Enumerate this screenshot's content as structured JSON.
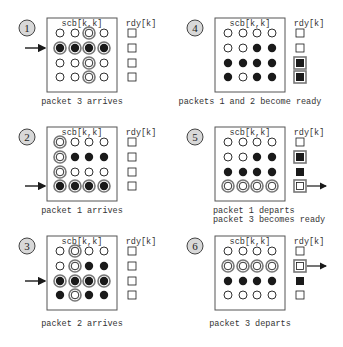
{
  "colors": {
    "ink": "#1a1a1a",
    "ring": "#777777",
    "badge_fill": "#d8d8d8",
    "frame": "#555555"
  },
  "labels": {
    "matrix": "scb[k,k]",
    "ready": "rdy[k]"
  },
  "legend_states": {
    "o": "empty",
    "f": "filled",
    "r": "ring (highlighted empty)",
    "F": "filled with ring (highlighted filled)"
  },
  "panels": [
    {
      "id": "1",
      "col": 0,
      "row": 0,
      "caption": [
        "packet 3 arrives"
      ],
      "matrix": [
        [
          "o",
          "o",
          "r",
          "o"
        ],
        [
          "F",
          "F",
          "F",
          "F"
        ],
        [
          "o",
          "o",
          "r",
          "o"
        ],
        [
          "o",
          "o",
          "r",
          "o"
        ]
      ],
      "rdy": [
        "o",
        "o",
        "o",
        "o"
      ],
      "in_arrow_row": 1,
      "out_arrow_row": null
    },
    {
      "id": "2",
      "col": 0,
      "row": 1,
      "caption": [
        "packet 1 arrives"
      ],
      "matrix": [
        [
          "r",
          "o",
          "o",
          "o"
        ],
        [
          "r",
          "f",
          "f",
          "f"
        ],
        [
          "r",
          "o",
          "o",
          "o"
        ],
        [
          "F",
          "F",
          "F",
          "F"
        ]
      ],
      "rdy": [
        "o",
        "o",
        "o",
        "o"
      ],
      "in_arrow_row": 3,
      "out_arrow_row": null
    },
    {
      "id": "3",
      "col": 0,
      "row": 2,
      "caption": [
        "packet 2 arrives"
      ],
      "matrix": [
        [
          "o",
          "r",
          "o",
          "o"
        ],
        [
          "o",
          "r",
          "f",
          "f"
        ],
        [
          "F",
          "F",
          "F",
          "F"
        ],
        [
          "f",
          "r",
          "f",
          "f"
        ]
      ],
      "rdy": [
        "o",
        "o",
        "o",
        "o"
      ],
      "in_arrow_row": 2,
      "out_arrow_row": null
    },
    {
      "id": "4",
      "col": 1,
      "row": 0,
      "caption": [
        "packets 1 and 2 become ready"
      ],
      "matrix": [
        [
          "o",
          "o",
          "o",
          "o"
        ],
        [
          "o",
          "o",
          "f",
          "f"
        ],
        [
          "f",
          "f",
          "f",
          "f"
        ],
        [
          "f",
          "o",
          "f",
          "f"
        ]
      ],
      "rdy": [
        "o",
        "o",
        "F",
        "F"
      ],
      "in_arrow_row": null,
      "out_arrow_row": null
    },
    {
      "id": "5",
      "col": 1,
      "row": 1,
      "caption": [
        "packet 1 departs",
        "packet 3 becomes ready"
      ],
      "matrix": [
        [
          "o",
          "o",
          "o",
          "o"
        ],
        [
          "o",
          "o",
          "f",
          "f"
        ],
        [
          "f",
          "f",
          "f",
          "f"
        ],
        [
          "r",
          "r",
          "r",
          "r"
        ]
      ],
      "rdy": [
        "o",
        "F",
        "f",
        "r"
      ],
      "in_arrow_row": null,
      "out_arrow_row": 3
    },
    {
      "id": "6",
      "col": 1,
      "row": 2,
      "caption": [
        "packet 3 departs"
      ],
      "matrix": [
        [
          "o",
          "o",
          "o",
          "o"
        ],
        [
          "r",
          "r",
          "r",
          "r"
        ],
        [
          "f",
          "f",
          "f",
          "f"
        ],
        [
          "o",
          "o",
          "o",
          "o"
        ]
      ],
      "rdy": [
        "o",
        "r",
        "f",
        "o"
      ],
      "in_arrow_row": null,
      "out_arrow_row": 1
    }
  ]
}
